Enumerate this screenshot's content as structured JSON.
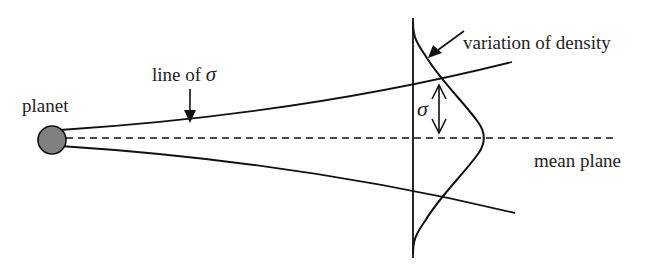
{
  "diagram": {
    "labels": {
      "planet": "planet",
      "line_of_sigma_prefix": "line of ",
      "sigma": "σ",
      "variation_of_density": "variation of density",
      "mean_plane": "mean plane"
    },
    "colors": {
      "stroke": "#111111",
      "planet_fill": "#808080",
      "background": "#ffffff"
    }
  }
}
